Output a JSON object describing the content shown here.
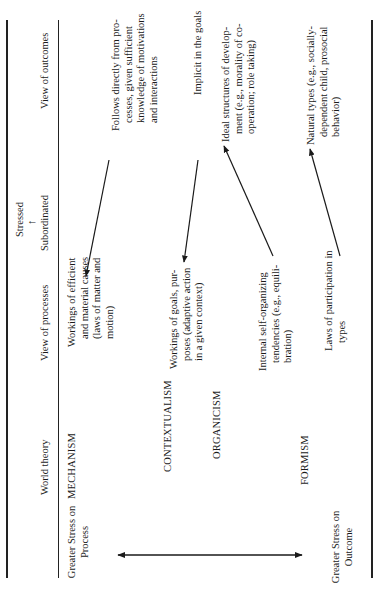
{
  "orientation": "rotated-90-ccw",
  "table": {
    "header": {
      "world_theory": "World theory",
      "view_of_processes": "View of processes",
      "stressed": "Stressed",
      "subordinated": "Subordinated",
      "view_of_outcomes": "View of outcomes"
    },
    "axis": {
      "process_end": "Greater Stress on Process",
      "outcome_end": "Greater Stress on Outcome"
    },
    "world_theories": [
      {
        "name": "MECHANISM",
        "process": "Workings of efficient and material causes (laws of matter and motion)",
        "outcome": "Follows directly from processes, given sufficient knowledge of motivations and interactions",
        "stressed": "process"
      },
      {
        "name": "CONTEXTUALISM",
        "process": "Workings of goals, purposes (adaptive action in a given context)",
        "outcome": "Implicit in the goals",
        "stressed": "process"
      },
      {
        "name": "ORGANICISM",
        "process": "Internal self-organizing tendencies (e.g., equilibration)",
        "outcome": "Ideal structures of development (e.g., morality of cooperation; role taking)",
        "stressed": "outcome"
      },
      {
        "name": "FORMISM",
        "process": "Laws of participation in types",
        "outcome": "Natural types (e.g., socially-dependent child, prosocial behavior)",
        "stressed": "outcome"
      }
    ]
  },
  "lines": {
    "mech_process": [
      "Workings of efficient",
      "and material causes",
      "(laws of matter and",
      "motion)"
    ],
    "mech_outcome": [
      "Follows directly from pro-",
      "cesses, given sufficient",
      "knowledge of motivations",
      "and interactions"
    ],
    "ctx_process": [
      "Workings of goals, pur-",
      "poses (adaptive action",
      "in a given context)"
    ],
    "ctx_outcome": [
      "Implicit in the goals"
    ],
    "org_process": [
      "Internal self-organizing",
      "tendencies (e.g., equili-",
      "bration)"
    ],
    "org_outcome": [
      "Ideal structures of develop-",
      "ment (e.g., morality of co-",
      "operation; role taking)"
    ],
    "form_process": [
      "Laws of participation in",
      "types"
    ],
    "form_outcome": [
      "Natural types (e.g., socially-",
      "dependent child, prosocial",
      "behavior)"
    ],
    "process_end": [
      "Greater Stress on",
      "Process"
    ],
    "outcome_end": [
      "Greater Stress on",
      "Outcome"
    ]
  }
}
